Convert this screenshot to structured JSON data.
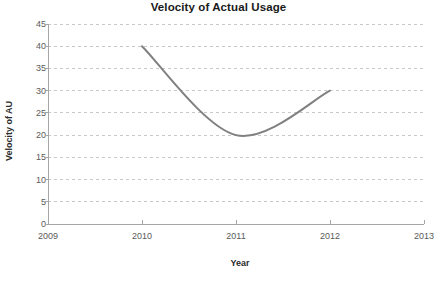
{
  "chart_data": {
    "type": "line",
    "title": "Velocity of Actual Usage",
    "xlabel": "Year",
    "ylabel": "Velocity of AU",
    "x": [
      2010,
      2011,
      2012
    ],
    "values": [
      40,
      20,
      30
    ],
    "categories": [
      "2010",
      "2011",
      "2012"
    ],
    "x_tick_labels": [
      "2009",
      "2010",
      "2011",
      "2012",
      "2013"
    ],
    "x_ticks": [
      2009,
      2010,
      2011,
      2012,
      2013
    ],
    "xlim": [
      2009,
      2013
    ],
    "y_tick_labels": [
      "0",
      "5",
      "10",
      "15",
      "20",
      "25",
      "30",
      "35",
      "40",
      "45"
    ],
    "y_ticks": [
      0,
      5,
      10,
      15,
      20,
      25,
      30,
      35,
      40,
      45
    ],
    "ylim": [
      0,
      45
    ],
    "grid": "horizontal-dashed",
    "legend": "none",
    "series": [
      {
        "name": "Velocity of AU",
        "smooth": true,
        "line_color": "#808080",
        "line_width": 2,
        "points": [
          {
            "x": 2010,
            "y": 40
          },
          {
            "x": 2011,
            "y": 20
          },
          {
            "x": 2012,
            "y": 30
          }
        ]
      }
    ],
    "colors": {
      "line": "#808080",
      "grid": "#c9c9c9",
      "axis": "#a6a6a6",
      "tick_text": "#5a5a5a",
      "title_text": "#1a1a1a",
      "background": "#ffffff"
    }
  }
}
